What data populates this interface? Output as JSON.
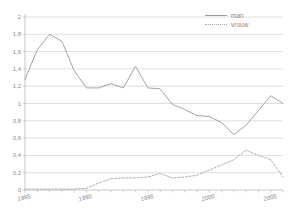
{
  "chart_data": {
    "type": "line",
    "title": "",
    "subtitle": "",
    "xlabel": "",
    "ylabel": "",
    "xlim": [
      1985,
      2006
    ],
    "ylim": [
      0,
      2
    ],
    "grid": "horizontal",
    "legend_position": "top-right",
    "decimal_separator": ",",
    "x": [
      1985,
      1986,
      1987,
      1988,
      1989,
      1990,
      1991,
      1992,
      1993,
      1994,
      1995,
      1996,
      1997,
      1998,
      1999,
      2000,
      2001,
      2002,
      2003,
      2004,
      2005,
      2006
    ],
    "xtick_labels": [
      "1985",
      "1990",
      "1995",
      "2000",
      "2005"
    ],
    "xtick_values": [
      1985,
      1990,
      1995,
      2000,
      2005
    ],
    "ytick_labels": [
      "0",
      "0,2",
      "0,4",
      "0,6",
      "0,8",
      "1",
      "1,2",
      "1,4",
      "1,6",
      "1,8",
      "2"
    ],
    "ytick_values": [
      0,
      0.2,
      0.4,
      0.6,
      0.8,
      1,
      1.2,
      1.4,
      1.6,
      1.8,
      2
    ],
    "series": [
      {
        "name": "man",
        "style": "solid",
        "color": "#9a9a9a",
        "values": [
          1.28,
          1.62,
          1.8,
          1.72,
          1.38,
          1.18,
          1.18,
          1.23,
          1.18,
          1.43,
          1.18,
          1.17,
          0.99,
          0.93,
          0.86,
          0.85,
          0.78,
          0.64,
          0.75,
          0.92,
          1.09,
          1.0
        ]
      },
      {
        "name": "vrouw",
        "style": "dotted",
        "color": "#a8a8a8",
        "values": [
          0.01,
          0.01,
          0.01,
          0.01,
          0.01,
          0.02,
          0.08,
          0.13,
          0.14,
          0.14,
          0.15,
          0.19,
          0.14,
          0.15,
          0.17,
          0.23,
          0.29,
          0.35,
          0.46,
          0.4,
          0.35,
          0.15
        ]
      }
    ]
  },
  "legend": {
    "items": [
      {
        "label": "man",
        "style": "solid"
      },
      {
        "label": "vrouw",
        "style": "dotted"
      }
    ]
  },
  "axis": {
    "y_labels": [
      "2",
      "1,8",
      "1,6",
      "1,4",
      "1,2",
      "1",
      "0,8",
      "0,6",
      "0,4",
      "0,2",
      "0"
    ],
    "x_labels": [
      "1985",
      "1990",
      "1995",
      "2000",
      "2005"
    ]
  },
  "colors": {
    "background": "#ffffff",
    "grid": "#c9c9c9",
    "axis": "#b0b0b0",
    "text": "#8c8c8c",
    "series_man": "#9a9a9a",
    "series_vrouw": "#a8a8a8"
  }
}
